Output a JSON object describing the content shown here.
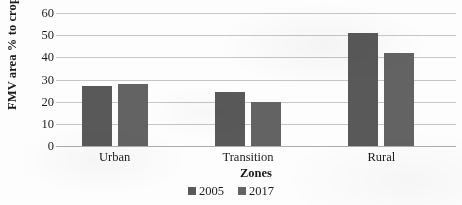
{
  "chart_data": {
    "type": "bar",
    "title": "",
    "subtitle": "",
    "xlabel": "Zones",
    "ylabel": "FMV area % to crop area",
    "categories": [
      "Urban",
      "Transition",
      "Rural"
    ],
    "series": [
      {
        "name": "2005",
        "values": [
          27,
          24.5,
          51
        ],
        "color": "#595959"
      },
      {
        "name": "2017",
        "values": [
          28,
          20,
          42
        ],
        "color": "#636363"
      }
    ],
    "ylim": [
      0,
      60
    ],
    "yticks": [
      0,
      10,
      20,
      30,
      40,
      50,
      60
    ],
    "ytick_labels": [
      "0",
      "10",
      "20",
      "30",
      "40",
      "50",
      "60"
    ],
    "grid": "horizontal",
    "legend_position": "bottom-center",
    "plot_background": "#ffffff",
    "gridline_color": "#c6c6c6"
  },
  "legend": {
    "entries": [
      {
        "label": "2005",
        "swatch": "legend-swatch-2005"
      },
      {
        "label": "2017",
        "swatch": "legend-swatch-2017"
      }
    ]
  }
}
